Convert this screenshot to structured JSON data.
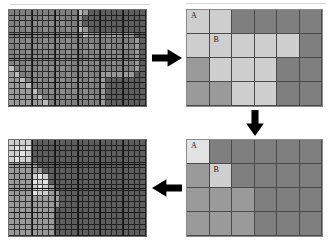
{
  "figure": {
    "background": "#ffffff",
    "width": 332,
    "height": 244
  },
  "palette": {
    "very_light": "#e3e3e3",
    "light": "#cfcfcf",
    "light_mid": "#bdbdbd",
    "medium": "#9a9a9a",
    "mid_dark": "#7f7f7f",
    "dark": "#5e5e5e",
    "very_dark": "#4c4c4c",
    "grid_line": "#141414",
    "arrow": "#000000",
    "panel_border": "#7d7d7d",
    "label_text": "#1a1a1a"
  },
  "panels": [
    {
      "id": "top-left",
      "name": "fine-raster-original",
      "type": "fine",
      "x": 8,
      "y": 9,
      "width": 139,
      "height": 98,
      "cols": 24,
      "rows": 17,
      "coarse_cols": 6,
      "coarse_rows": 4,
      "values": [
        [
          5,
          5,
          5,
          5,
          5,
          5,
          5,
          5,
          5,
          5,
          5,
          5,
          4,
          3,
          2,
          2,
          2,
          2,
          2,
          2,
          2,
          2,
          2,
          2
        ],
        [
          5,
          6,
          5,
          6,
          5,
          5,
          6,
          5,
          6,
          5,
          5,
          5,
          3,
          2,
          2,
          2,
          2,
          2,
          2,
          2,
          2,
          2,
          2,
          2
        ],
        [
          5,
          5,
          6,
          5,
          6,
          6,
          5,
          6,
          5,
          6,
          5,
          5,
          3,
          2,
          2,
          2,
          2,
          2,
          2,
          2,
          2,
          2,
          2,
          2
        ],
        [
          5,
          6,
          5,
          6,
          5,
          5,
          6,
          5,
          6,
          5,
          6,
          5,
          4,
          3,
          2,
          2,
          2,
          2,
          2,
          2,
          2,
          2,
          2,
          2
        ],
        [
          5,
          5,
          6,
          5,
          6,
          6,
          5,
          6,
          5,
          6,
          5,
          6,
          5,
          4,
          3,
          3,
          3,
          3,
          3,
          3,
          3,
          3,
          2,
          2
        ],
        [
          5,
          6,
          5,
          6,
          5,
          5,
          6,
          5,
          6,
          5,
          6,
          5,
          5,
          5,
          5,
          5,
          5,
          5,
          5,
          5,
          5,
          5,
          3,
          2
        ],
        [
          5,
          5,
          6,
          5,
          6,
          6,
          5,
          6,
          5,
          6,
          5,
          6,
          5,
          5,
          6,
          5,
          5,
          6,
          5,
          5,
          6,
          5,
          3,
          2
        ],
        [
          5,
          6,
          5,
          6,
          5,
          5,
          6,
          5,
          6,
          5,
          6,
          5,
          5,
          6,
          5,
          6,
          6,
          5,
          6,
          5,
          5,
          5,
          3,
          2
        ],
        [
          5,
          5,
          6,
          5,
          6,
          6,
          5,
          6,
          5,
          6,
          5,
          6,
          5,
          5,
          6,
          5,
          5,
          6,
          5,
          6,
          5,
          5,
          3,
          2
        ],
        [
          5,
          6,
          5,
          6,
          5,
          5,
          6,
          5,
          6,
          5,
          6,
          5,
          5,
          6,
          5,
          6,
          5,
          5,
          6,
          5,
          6,
          5,
          3,
          2
        ],
        [
          4,
          5,
          5,
          6,
          5,
          6,
          5,
          6,
          5,
          6,
          5,
          5,
          6,
          5,
          5,
          5,
          5,
          5,
          5,
          5,
          5,
          5,
          3,
          2
        ],
        [
          3,
          4,
          5,
          5,
          6,
          5,
          6,
          5,
          6,
          5,
          6,
          5,
          5,
          6,
          5,
          5,
          3,
          3,
          3,
          3,
          3,
          3,
          2,
          2
        ],
        [
          3,
          3,
          4,
          5,
          5,
          6,
          5,
          6,
          5,
          6,
          5,
          6,
          5,
          5,
          6,
          5,
          3,
          2,
          2,
          2,
          2,
          2,
          2,
          2
        ],
        [
          3,
          3,
          3,
          4,
          5,
          5,
          6,
          5,
          6,
          5,
          6,
          5,
          6,
          5,
          5,
          5,
          3,
          2,
          2,
          2,
          2,
          2,
          2,
          2
        ],
        [
          3,
          3,
          3,
          3,
          4,
          5,
          5,
          6,
          5,
          6,
          5,
          6,
          5,
          6,
          5,
          5,
          3,
          2,
          2,
          2,
          2,
          2,
          2,
          2
        ],
        [
          3,
          3,
          3,
          3,
          3,
          4,
          5,
          5,
          6,
          5,
          6,
          5,
          6,
          5,
          6,
          5,
          3,
          2,
          2,
          2,
          2,
          2,
          2,
          2
        ],
        [
          3,
          3,
          3,
          3,
          3,
          3,
          4,
          5,
          5,
          5,
          5,
          5,
          5,
          5,
          5,
          5,
          3,
          2,
          2,
          2,
          2,
          2,
          2,
          2
        ]
      ]
    },
    {
      "id": "top-right",
      "name": "coarse-raster-aggregated",
      "type": "coarse",
      "x": 186,
      "y": 9,
      "width": 137,
      "height": 98,
      "cols": 6,
      "rows": 4,
      "values": [
        [
          1,
          1,
          5,
          5,
          5,
          5
        ],
        [
          1,
          1,
          1,
          1,
          1,
          5
        ],
        [
          3,
          1,
          1,
          1,
          5,
          5
        ],
        [
          3,
          3,
          1,
          1,
          5,
          5
        ]
      ],
      "labels": [
        {
          "row": 0,
          "col": 0,
          "text": "A"
        },
        {
          "row": 1,
          "col": 1,
          "text": "B"
        }
      ]
    },
    {
      "id": "bottom-right",
      "name": "coarse-raster-reclassified",
      "type": "coarse",
      "x": 186,
      "y": 139,
      "width": 137,
      "height": 98,
      "cols": 6,
      "rows": 4,
      "values": [
        [
          0,
          5,
          5,
          5,
          5,
          5
        ],
        [
          3,
          1,
          5,
          5,
          5,
          5
        ],
        [
          3,
          3,
          3,
          5,
          5,
          5
        ],
        [
          3,
          3,
          3,
          5,
          5,
          5
        ]
      ],
      "labels": [
        {
          "row": 0,
          "col": 0,
          "text": "A"
        },
        {
          "row": 1,
          "col": 1,
          "text": "B"
        }
      ]
    },
    {
      "id": "bottom-left",
      "name": "fine-raster-result",
      "type": "fine",
      "x": 8,
      "y": 139,
      "width": 139,
      "height": 98,
      "cols": 24,
      "rows": 17,
      "coarse_cols": 6,
      "coarse_rows": 4,
      "values": [
        [
          1,
          1,
          1,
          1,
          2,
          2,
          2,
          2,
          2,
          2,
          2,
          2,
          2,
          2,
          2,
          2,
          2,
          2,
          2,
          2,
          2,
          2,
          2,
          2
        ],
        [
          1,
          0,
          1,
          0,
          2,
          2,
          2,
          2,
          2,
          2,
          2,
          2,
          2,
          2,
          2,
          2,
          2,
          2,
          2,
          2,
          2,
          2,
          2,
          2
        ],
        [
          1,
          1,
          0,
          1,
          2,
          2,
          2,
          2,
          2,
          2,
          2,
          2,
          2,
          2,
          2,
          2,
          2,
          2,
          2,
          2,
          2,
          2,
          2,
          2
        ],
        [
          1,
          0,
          1,
          1,
          2,
          2,
          2,
          2,
          2,
          2,
          2,
          2,
          2,
          2,
          2,
          2,
          2,
          2,
          2,
          2,
          2,
          2,
          2,
          2
        ],
        [
          3,
          3,
          3,
          3,
          3,
          2,
          2,
          2,
          2,
          2,
          2,
          2,
          2,
          2,
          2,
          2,
          2,
          2,
          2,
          2,
          2,
          2,
          2,
          2
        ],
        [
          3,
          3,
          3,
          3,
          3,
          3,
          2,
          2,
          2,
          2,
          2,
          2,
          2,
          2,
          2,
          2,
          2,
          2,
          2,
          2,
          2,
          2,
          2,
          2
        ],
        [
          3,
          3,
          3,
          3,
          1,
          0,
          1,
          2,
          2,
          2,
          2,
          2,
          2,
          2,
          2,
          2,
          2,
          2,
          2,
          2,
          2,
          2,
          2,
          2
        ],
        [
          3,
          3,
          3,
          3,
          0,
          1,
          0,
          2,
          2,
          2,
          2,
          2,
          2,
          2,
          2,
          2,
          2,
          2,
          2,
          2,
          2,
          2,
          2,
          2
        ],
        [
          3,
          3,
          3,
          3,
          1,
          0,
          1,
          3,
          2,
          2,
          2,
          2,
          2,
          2,
          2,
          2,
          2,
          2,
          2,
          2,
          2,
          2,
          2,
          2
        ],
        [
          3,
          3,
          3,
          3,
          0,
          1,
          1,
          3,
          3,
          2,
          2,
          2,
          2,
          2,
          2,
          2,
          2,
          2,
          2,
          2,
          2,
          2,
          2,
          2
        ],
        [
          3,
          3,
          3,
          3,
          3,
          3,
          3,
          3,
          3,
          2,
          2,
          2,
          2,
          2,
          2,
          2,
          2,
          2,
          2,
          2,
          2,
          2,
          2,
          2
        ],
        [
          3,
          3,
          3,
          3,
          3,
          3,
          3,
          3,
          3,
          2,
          2,
          2,
          2,
          2,
          2,
          2,
          2,
          2,
          2,
          2,
          2,
          2,
          2,
          2
        ],
        [
          3,
          3,
          3,
          3,
          3,
          3,
          3,
          3,
          2,
          2,
          2,
          2,
          2,
          2,
          2,
          2,
          2,
          2,
          2,
          2,
          2,
          2,
          2,
          2
        ],
        [
          3,
          3,
          3,
          3,
          3,
          3,
          3,
          3,
          2,
          2,
          2,
          2,
          2,
          2,
          2,
          2,
          2,
          2,
          2,
          2,
          2,
          2,
          2,
          2
        ],
        [
          3,
          3,
          3,
          3,
          3,
          3,
          3,
          3,
          2,
          2,
          2,
          2,
          2,
          2,
          2,
          2,
          2,
          2,
          2,
          2,
          2,
          2,
          2,
          2
        ],
        [
          3,
          3,
          3,
          3,
          3,
          3,
          3,
          3,
          2,
          2,
          2,
          2,
          2,
          2,
          2,
          2,
          2,
          2,
          2,
          2,
          2,
          2,
          2,
          2
        ],
        [
          3,
          3,
          3,
          3,
          3,
          3,
          3,
          3,
          2,
          2,
          2,
          2,
          2,
          2,
          2,
          2,
          2,
          2,
          2,
          2,
          2,
          2,
          2,
          2
        ]
      ]
    }
  ],
  "arrows": [
    {
      "id": "arrow-right",
      "name": "arrow-right",
      "direction": "right",
      "x": 152,
      "y": 47,
      "width": 30,
      "height": 22
    },
    {
      "id": "arrow-down",
      "name": "arrow-down",
      "direction": "down",
      "x": 244,
      "y": 110,
      "width": 22,
      "height": 26
    },
    {
      "id": "arrow-left",
      "name": "arrow-left",
      "direction": "left",
      "x": 152,
      "y": 177,
      "width": 30,
      "height": 22
    }
  ],
  "chart_data": {
    "type": "heatmap",
    "xlabel": "",
    "ylabel": "",
    "grid": true,
    "legend": "none",
    "value_scale": [
      0,
      1,
      2,
      3,
      4,
      5,
      6
    ],
    "value_colors": [
      "#e3e3e3",
      "#cfcfcf",
      "#5e5e5e",
      "#9a9a9a",
      "#bdbdbd",
      "#7f7f7f",
      "#8c8c8c"
    ],
    "annotations": [
      "A",
      "B"
    ],
    "flow": [
      "fine-raster-original",
      "coarse-raster-aggregated",
      "coarse-raster-reclassified",
      "fine-raster-result"
    ]
  }
}
